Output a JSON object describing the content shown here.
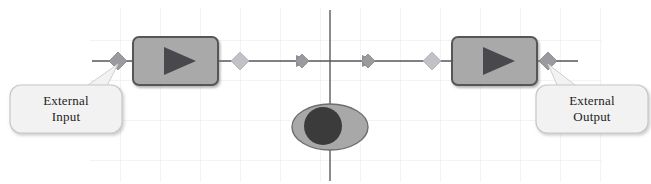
{
  "diagram": {
    "background_color": "#ffffff",
    "grid": {
      "visible": true,
      "color": "#e7e7ea",
      "spacing_px": 40,
      "x_start": 90,
      "x_end": 600,
      "y_start": 10,
      "y_end": 180
    },
    "axis": {
      "horizontal_line_color": "#6f6f74",
      "vertical_line_color": "#6f6f74",
      "vertical_line_x": 330,
      "horizontal_line_y": 61
    },
    "blocks": [
      {
        "id": "amplifier-left",
        "name": "amplifier-block-left",
        "symbol": "triangle-right",
        "fill_color": "#a9a9a9",
        "border_color": "#55565a",
        "x": 133,
        "y": 37,
        "width": 85,
        "height": 48
      },
      {
        "id": "amplifier-right",
        "name": "amplifier-block-right",
        "symbol": "triangle-right",
        "fill_color": "#a9a9a9",
        "border_color": "#55565a",
        "x": 452,
        "y": 37,
        "width": 85,
        "height": 48
      }
    ],
    "eye": {
      "id": "observer-eye",
      "label": "eye-icon",
      "center_x": 330,
      "center_y": 127,
      "rx": 38,
      "ry": 23,
      "iris_center_x": 323,
      "iris_radius": 19,
      "sclera_color": "#a8a8a8",
      "iris_color": "#3b3b3b"
    },
    "connectors": [
      {
        "name": "node-diamond-input",
        "x": 118,
        "y": 61,
        "color": "#9b9b9f"
      },
      {
        "name": "node-diamond-post-amp-left",
        "x": 240,
        "y": 61,
        "color": "#b4b4b8"
      },
      {
        "name": "node-diamond-mid-left",
        "x": 302,
        "y": 61,
        "color": "#9b9b9f"
      },
      {
        "name": "node-diamond-mid-right",
        "x": 368,
        "y": 61,
        "color": "#9b9b9f"
      },
      {
        "name": "node-diamond-pre-amp-right",
        "x": 432,
        "y": 61,
        "color": "#b4b4b8"
      },
      {
        "name": "node-diamond-output",
        "x": 548,
        "y": 61,
        "color": "#9b9b9f"
      }
    ],
    "callouts": [
      {
        "id": "external-input",
        "name": "callout-external-input",
        "line1": "External",
        "line2": "Input",
        "x": 10,
        "y": 85,
        "width": 112,
        "height": 48,
        "fill_color": "#f2f2f2",
        "border_color": "#c8c8c8",
        "text_color": "#1e1e22",
        "anchor_x": 118,
        "anchor_y": 61
      },
      {
        "id": "external-output",
        "name": "callout-external-output",
        "line1": "External",
        "line2": "Output",
        "x": 536,
        "y": 85,
        "width": 112,
        "height": 48,
        "fill_color": "#f2f2f2",
        "border_color": "#c8c8c8",
        "text_color": "#1e1e22",
        "anchor_x": 548,
        "anchor_y": 61
      }
    ]
  }
}
